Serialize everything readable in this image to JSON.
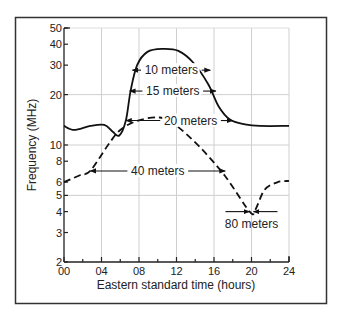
{
  "chart_data": {
    "type": "line",
    "title": "",
    "xlabel": "Eastern standard time (hours)",
    "ylabel": "Frequency (MHz)",
    "xlim": [
      0,
      24
    ],
    "ylim": [
      2,
      50
    ],
    "yscale": "log",
    "grid": true,
    "x_ticks": [
      "00",
      "04",
      "08",
      "12",
      "16",
      "20",
      "24"
    ],
    "x_tick_values": [
      0,
      4,
      8,
      12,
      16,
      20,
      24
    ],
    "y_ticks": [
      "2",
      "3",
      "4",
      "5",
      "6",
      "8",
      "10",
      "20",
      "30",
      "40",
      "50"
    ],
    "y_tick_values": [
      2,
      3,
      4,
      5,
      6,
      8,
      10,
      20,
      30,
      40,
      50
    ],
    "series": [
      {
        "name": "Maximum usable frequency (solid)",
        "style": "solid",
        "x": [
          0,
          1.1,
          2.8,
          4.3,
          5.2,
          5.9,
          6.6,
          7.1,
          7.8,
          8.9,
          10.5,
          12.2,
          13.8,
          15.4,
          16.5,
          17.7,
          19.3,
          20.9,
          24
        ],
        "y": [
          13,
          12.3,
          13,
          13.2,
          12,
          11.4,
          14,
          21,
          30,
          36,
          37.5,
          36.5,
          31,
          23,
          17,
          14.2,
          13.3,
          13,
          13
        ]
      },
      {
        "name": "Lower frequency (dashed)",
        "style": "dashed",
        "x": [
          0,
          1.7,
          2.8,
          4.7,
          6.0,
          7.9,
          10.2,
          11.8,
          14.5,
          17.2,
          19.8,
          20.4,
          21.4,
          22.8,
          24
        ],
        "y": [
          6.0,
          6.6,
          7.0,
          10.0,
          12.3,
          14.0,
          14.6,
          13.3,
          9.7,
          6.5,
          4.0,
          4.1,
          5.4,
          6.0,
          6.1
        ]
      }
    ],
    "annotations": [
      {
        "text": "10 meters",
        "x_range": [
          7.3,
          15.6
        ],
        "freq": 28
      },
      {
        "text": "15 meters",
        "x_range": [
          7.0,
          16.2
        ],
        "freq": 21
      },
      {
        "text": "20 meters",
        "x_range": [
          6.6,
          18.0
        ],
        "freq": 14
      },
      {
        "text": "40 meters",
        "x_range": [
          2.8,
          17.2
        ],
        "freq": 7
      },
      {
        "text": "80 meters",
        "x_range": [
          19.6,
          20.4
        ],
        "freq": 4
      }
    ]
  }
}
